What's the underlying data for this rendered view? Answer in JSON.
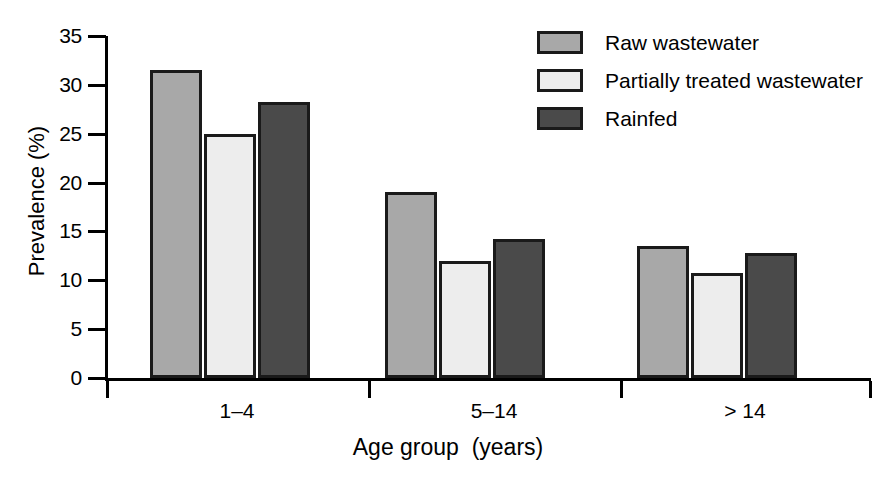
{
  "chart_data": {
    "type": "bar",
    "title": "",
    "xlabel": "Age group  (years)",
    "ylabel": "Prevalence (%)",
    "categories": [
      "1–4",
      "5–14",
      "> 14"
    ],
    "series": [
      {
        "name": "Raw wastewater",
        "color": "#a8a8a8",
        "values": [
          31.5,
          19.0,
          13.5
        ]
      },
      {
        "name": "Partially treated wastewater",
        "color": "#ededed",
        "values": [
          25.0,
          12.0,
          10.7
        ]
      },
      {
        "name": "Rainfed",
        "color": "#4a4a4a",
        "values": [
          28.2,
          14.2,
          12.8
        ]
      }
    ],
    "ylim": [
      0,
      35
    ],
    "ytick_values": [
      35,
      30,
      25,
      20,
      15,
      10,
      5,
      0
    ],
    "ytick_labels": [
      "35",
      "30",
      "25",
      "20",
      "15",
      "10",
      "5",
      "0"
    ],
    "grid": false,
    "legend_position": "top-right",
    "bar_edge_color": "#1a1a1a",
    "background_color": "#ffffff"
  },
  "axes": {
    "y_title": "Prevalence (%)",
    "x_title": "Age group  (years)",
    "y_ticks": [
      "35",
      "30",
      "25",
      "20",
      "15",
      "10",
      "5",
      "0"
    ],
    "x_categories": [
      "1–4",
      "5–14",
      "> 14"
    ]
  },
  "legend": {
    "items": [
      {
        "label": "Raw wastewater",
        "color": "#a8a8a8"
      },
      {
        "label": "Partially treated wastewater",
        "color": "#ededed"
      },
      {
        "label": "Rainfed",
        "color": "#4a4a4a"
      }
    ]
  }
}
